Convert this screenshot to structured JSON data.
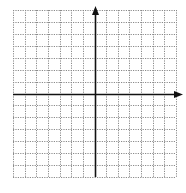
{
  "diagram": {
    "type": "coordinate-plane",
    "grid": {
      "columns": 14,
      "rows": 14,
      "left": 13,
      "top": 10,
      "right": 176,
      "bottom": 177,
      "line_style": "dotted",
      "line_color": "#8a8a8a"
    },
    "axes": {
      "x_axis_row_index": 7,
      "y_axis_col_index": 7,
      "color": "#111111",
      "x_arrow": "positive-end",
      "y_arrow": "positive-end",
      "x_arrow_tip_x": 183,
      "y_arrow_tip_y": 6
    },
    "labels": []
  }
}
